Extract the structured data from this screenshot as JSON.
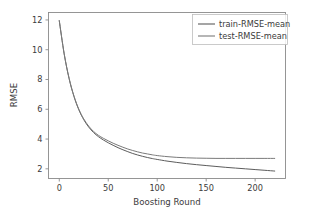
{
  "chart_data": {
    "type": "line",
    "title": "",
    "xlabel": "Boosting Round",
    "ylabel": "RMSE",
    "xlim": [
      -11,
      231
    ],
    "ylim": [
      1.35,
      12.5
    ],
    "xticks": [
      0,
      50,
      100,
      150,
      200
    ],
    "xtick_labels": [
      "0",
      "50",
      "100",
      "150",
      "200"
    ],
    "yticks": [
      2,
      4,
      6,
      8,
      10,
      12
    ],
    "ytick_labels": [
      "2",
      "4",
      "6",
      "8",
      "10",
      "12"
    ],
    "grid": false,
    "legend_position": "upper right",
    "series": [
      {
        "name": "train-RMSE-mean",
        "color": "#5c5c5c",
        "x": [
          0,
          5,
          10,
          15,
          20,
          25,
          30,
          35,
          40,
          45,
          50,
          55,
          60,
          65,
          70,
          75,
          80,
          85,
          90,
          95,
          100,
          110,
          120,
          130,
          140,
          150,
          160,
          170,
          180,
          190,
          200,
          210,
          220
        ],
        "y": [
          11.95,
          9.72,
          8.07,
          6.86,
          5.96,
          5.3,
          4.81,
          4.44,
          4.16,
          3.94,
          3.75,
          3.58,
          3.42,
          3.28,
          3.15,
          3.03,
          2.93,
          2.84,
          2.76,
          2.69,
          2.63,
          2.52,
          2.43,
          2.35,
          2.28,
          2.22,
          2.16,
          2.1,
          2.05,
          2.0,
          1.95,
          1.9,
          1.85
        ]
      },
      {
        "name": "test-RMSE-mean",
        "color": "#7a7a7a",
        "x": [
          0,
          5,
          10,
          15,
          20,
          25,
          30,
          35,
          40,
          45,
          50,
          55,
          60,
          65,
          70,
          75,
          80,
          85,
          90,
          95,
          100,
          110,
          120,
          130,
          140,
          150,
          160,
          170,
          180,
          190,
          200,
          210,
          220
        ],
        "y": [
          11.95,
          9.73,
          8.09,
          6.89,
          6.0,
          5.35,
          4.87,
          4.51,
          4.25,
          4.05,
          3.88,
          3.72,
          3.58,
          3.45,
          3.33,
          3.23,
          3.14,
          3.06,
          3.0,
          2.94,
          2.89,
          2.82,
          2.77,
          2.74,
          2.72,
          2.71,
          2.7,
          2.7,
          2.7,
          2.7,
          2.7,
          2.7,
          2.7
        ]
      }
    ]
  },
  "legend": {
    "entries": [
      {
        "label": "train-RMSE-mean",
        "color": "#5c5c5c"
      },
      {
        "label": "test-RMSE-mean",
        "color": "#7a7a7a"
      }
    ]
  },
  "style": {
    "background": "#ffffff",
    "spine_color": "#8a8a8a",
    "text_color": "#3b3b3b",
    "legend_border": "#bdbdbd"
  }
}
